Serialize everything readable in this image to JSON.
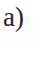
{
  "figure": {
    "panel_label": "a)",
    "label_text_color": "#262626",
    "background_color": "#ffffff",
    "panel_body_text": ""
  }
}
